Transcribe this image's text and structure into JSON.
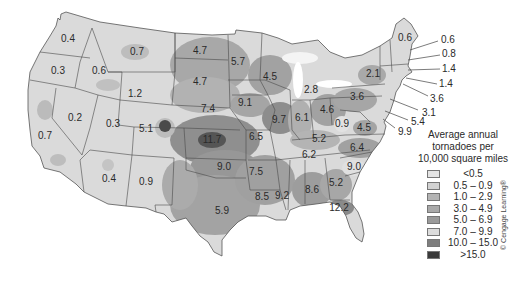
{
  "map": {
    "title": "Average annual tornadoes per 10,000 square miles",
    "region": "Contiguous United States",
    "colors": {
      "background": "#ffffff",
      "land_base": "#d8d8d8",
      "border": "#4a4a4a"
    },
    "state_labels": [
      {
        "value": "0.4",
        "x": 68,
        "y": 39
      },
      {
        "value": "0.3",
        "x": 58,
        "y": 71
      },
      {
        "value": "0.6",
        "x": 99,
        "y": 71
      },
      {
        "value": "0.7",
        "x": 137,
        "y": 52
      },
      {
        "value": "4.7",
        "x": 200,
        "y": 51
      },
      {
        "value": "5.7",
        "x": 238,
        "y": 62
      },
      {
        "value": "4.7",
        "x": 200,
        "y": 82
      },
      {
        "value": "1.2",
        "x": 135,
        "y": 94
      },
      {
        "value": "4.5",
        "x": 270,
        "y": 77
      },
      {
        "value": "2.8",
        "x": 311,
        "y": 90
      },
      {
        "value": "9.1",
        "x": 245,
        "y": 103
      },
      {
        "value": "7.4",
        "x": 208,
        "y": 109
      },
      {
        "value": "0.2",
        "x": 75,
        "y": 118
      },
      {
        "value": "0.3",
        "x": 113,
        "y": 124
      },
      {
        "value": "5.1",
        "x": 146,
        "y": 129
      },
      {
        "value": "0.7",
        "x": 45,
        "y": 136
      },
      {
        "value": "11.7",
        "x": 212,
        "y": 140
      },
      {
        "value": "6.5",
        "x": 256,
        "y": 137
      },
      {
        "value": "9.7",
        "x": 279,
        "y": 120
      },
      {
        "value": "6.1",
        "x": 302,
        "y": 118
      },
      {
        "value": "4.6",
        "x": 327,
        "y": 110
      },
      {
        "value": "3.6",
        "x": 357,
        "y": 97
      },
      {
        "value": "2.1",
        "x": 373,
        "y": 74
      },
      {
        "value": "0.6",
        "x": 405,
        "y": 38
      },
      {
        "value": "0.9",
        "x": 342,
        "y": 124
      },
      {
        "value": "4.5",
        "x": 364,
        "y": 128
      },
      {
        "value": "5.2",
        "x": 319,
        "y": 139
      },
      {
        "value": "6.2",
        "x": 309,
        "y": 155
      },
      {
        "value": "6.4",
        "x": 357,
        "y": 148
      },
      {
        "value": "9.0",
        "x": 224,
        "y": 167
      },
      {
        "value": "7.5",
        "x": 256,
        "y": 172
      },
      {
        "value": "9.0",
        "x": 354,
        "y": 167
      },
      {
        "value": "0.4",
        "x": 109,
        "y": 179
      },
      {
        "value": "0.9",
        "x": 146,
        "y": 182
      },
      {
        "value": "8.6",
        "x": 312,
        "y": 190
      },
      {
        "value": "5.2",
        "x": 336,
        "y": 183
      },
      {
        "value": "8.5",
        "x": 262,
        "y": 197
      },
      {
        "value": "9.2",
        "x": 282,
        "y": 196
      },
      {
        "value": "5.9",
        "x": 222,
        "y": 211
      },
      {
        "value": "12.2",
        "x": 339,
        "y": 208
      }
    ],
    "callout_labels": [
      {
        "value": "0.6",
        "x": 441,
        "y": 40,
        "from": [
          410,
          50
        ]
      },
      {
        "value": "0.8",
        "x": 442,
        "y": 53,
        "from": [
          408,
          60
        ]
      },
      {
        "value": "1.4",
        "x": 442,
        "y": 68,
        "from": [
          408,
          70
        ]
      },
      {
        "value": "1.4",
        "x": 439,
        "y": 84,
        "from": [
          406,
          78
        ]
      },
      {
        "value": "3.6",
        "x": 430,
        "y": 99,
        "from": [
          403,
          84
        ]
      },
      {
        "value": "3.1",
        "x": 422,
        "y": 113,
        "from": [
          390,
          99
        ]
      },
      {
        "value": "5.4",
        "x": 411,
        "y": 122,
        "from": [
          385,
          111
        ]
      },
      {
        "value": "9.9",
        "x": 398,
        "y": 132,
        "from": [
          383,
          119
        ]
      }
    ]
  },
  "legend": {
    "title_lines": [
      "Average annual",
      "tornadoes per",
      "10,000 square miles"
    ],
    "items": [
      {
        "label": "<0.5",
        "color": "#e4e4e4"
      },
      {
        "label": "0.5 – 0.9",
        "color": "#d2d2d2"
      },
      {
        "label": "1.0 – 2.9",
        "color": "#b4b4b4"
      },
      {
        "label": "3.0 – 4.9",
        "color": "#a9a9a9"
      },
      {
        "label": "5.0 – 6.9",
        "color": "#9a9a9a"
      },
      {
        "label": "7.0 – 9.9",
        "color": "#dcdcdc"
      },
      {
        "label": "10.0 – 15.0",
        "color": "#7e7e7e"
      },
      {
        "label": ">15.0",
        "color": "#3a3a3a"
      }
    ]
  },
  "copyright": "© Cengage Learning®"
}
